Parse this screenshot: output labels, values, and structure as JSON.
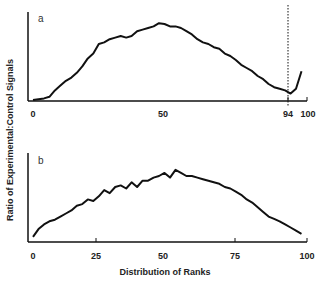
{
  "chart_data": [
    {
      "type": "line",
      "panel": "a",
      "title": "",
      "xlabel": "",
      "ylabel": "Ratio of Experimental:Control Signals",
      "xlim": [
        0,
        100
      ],
      "xticks": [
        "0",
        "50",
        "94",
        "100"
      ],
      "annotations": [
        {
          "type": "vline",
          "x": 94,
          "style": "dotted"
        }
      ],
      "x": [
        0,
        2,
        4,
        6,
        8,
        10,
        12,
        14,
        16,
        18,
        20,
        22,
        24,
        26,
        28,
        30,
        32,
        34,
        36,
        38,
        40,
        42,
        44,
        46,
        48,
        50,
        52,
        54,
        56,
        58,
        60,
        62,
        64,
        66,
        68,
        70,
        72,
        74,
        76,
        78,
        80,
        82,
        84,
        86,
        88,
        90,
        92,
        94,
        96,
        98
      ],
      "y": [
        0,
        0.01,
        0.02,
        0.04,
        0.12,
        0.18,
        0.24,
        0.28,
        0.34,
        0.42,
        0.52,
        0.58,
        0.7,
        0.72,
        0.76,
        0.78,
        0.8,
        0.78,
        0.8,
        0.86,
        0.88,
        0.9,
        0.92,
        0.96,
        0.95,
        0.92,
        0.92,
        0.9,
        0.86,
        0.82,
        0.76,
        0.72,
        0.7,
        0.66,
        0.64,
        0.58,
        0.55,
        0.5,
        0.44,
        0.4,
        0.36,
        0.3,
        0.26,
        0.2,
        0.16,
        0.14,
        0.12,
        0.08,
        0.14,
        0.36
      ]
    },
    {
      "type": "line",
      "panel": "b",
      "title": "",
      "xlabel": "Distribution of Ranks",
      "ylabel": "Ratio of Experimental:Control Signals",
      "xlim": [
        0,
        100
      ],
      "xticks": [
        "0",
        "25",
        "50",
        "75",
        "100"
      ],
      "x": [
        0,
        2,
        4,
        6,
        8,
        10,
        12,
        14,
        16,
        18,
        20,
        22,
        24,
        26,
        28,
        30,
        32,
        34,
        36,
        38,
        40,
        42,
        44,
        46,
        48,
        50,
        52,
        54,
        56,
        58,
        60,
        62,
        64,
        66,
        68,
        70,
        72,
        74,
        76,
        78,
        80,
        82,
        84,
        86,
        88,
        90,
        92,
        94,
        96,
        98
      ],
      "y": [
        0.04,
        0.14,
        0.2,
        0.24,
        0.26,
        0.3,
        0.34,
        0.38,
        0.44,
        0.46,
        0.52,
        0.5,
        0.56,
        0.64,
        0.6,
        0.68,
        0.7,
        0.66,
        0.74,
        0.68,
        0.76,
        0.76,
        0.8,
        0.82,
        0.86,
        0.8,
        0.9,
        0.86,
        0.82,
        0.82,
        0.8,
        0.78,
        0.76,
        0.74,
        0.72,
        0.68,
        0.66,
        0.62,
        0.58,
        0.52,
        0.48,
        0.42,
        0.36,
        0.3,
        0.27,
        0.24,
        0.2,
        0.16,
        0.12,
        0.08
      ]
    }
  ],
  "labels": {
    "panel_a": "a",
    "panel_b": "b",
    "ylabel": "Ratio of Experimental:Control Signals",
    "xlabel": "Distribution of Ranks"
  },
  "ticks_a": [
    "0",
    "50",
    "94",
    "100"
  ],
  "ticks_b": [
    "0",
    "25",
    "50",
    "75",
    "100"
  ]
}
